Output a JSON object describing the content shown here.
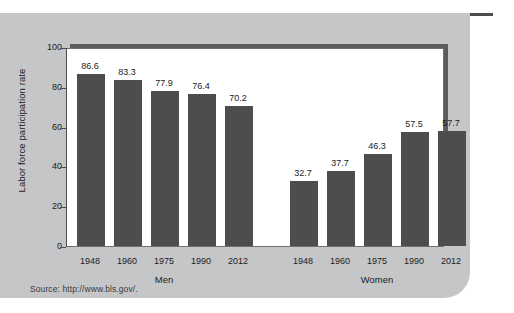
{
  "figure": {
    "source_note": "Source: http://www.bls.gov/."
  },
  "chart_data": {
    "type": "bar",
    "title": "",
    "xlabel": "",
    "ylabel": "Labor force participation rate",
    "ylim": [
      0,
      100
    ],
    "ytick_labels": [
      "0",
      "20",
      "40",
      "60",
      "80",
      "100"
    ],
    "ytick_values": [
      0,
      20,
      40,
      60,
      80,
      100
    ],
    "grid": false,
    "legend": "none",
    "group_labels": [
      "Men",
      "Women"
    ],
    "categories": [
      "1948",
      "1960",
      "1975",
      "1990",
      "2012"
    ],
    "series": [
      {
        "name": "Men",
        "values": [
          86.6,
          83.3,
          77.9,
          76.4,
          70.2
        ]
      },
      {
        "name": "Women",
        "values": [
          32.7,
          37.7,
          46.3,
          57.5,
          57.7
        ]
      }
    ],
    "bars": [
      {
        "group": "Men",
        "category": "1948",
        "value": 86.6,
        "label": "86.6"
      },
      {
        "group": "Men",
        "category": "1960",
        "value": 83.3,
        "label": "83.3"
      },
      {
        "group": "Men",
        "category": "1975",
        "value": 77.9,
        "label": "77.9"
      },
      {
        "group": "Men",
        "category": "1990",
        "value": 76.4,
        "label": "76.4"
      },
      {
        "group": "Men",
        "category": "2012",
        "value": 70.2,
        "label": "70.2"
      },
      {
        "group": "Women",
        "category": "1948",
        "value": 32.7,
        "label": "32.7"
      },
      {
        "group": "Women",
        "category": "1960",
        "value": 37.7,
        "label": "37.7"
      },
      {
        "group": "Women",
        "category": "1975",
        "value": 46.3,
        "label": "46.3"
      },
      {
        "group": "Women",
        "category": "1990",
        "value": 57.5,
        "label": "57.5"
      },
      {
        "group": "Women",
        "category": "2012",
        "value": 57.7,
        "label": "57.7"
      }
    ],
    "colors": {
      "bar": "#4d4d4f",
      "plot_background": "#ffffff",
      "card_background": "#c5c6c8",
      "axis": "#4d4d4f",
      "text": "#1c1c1c"
    }
  }
}
